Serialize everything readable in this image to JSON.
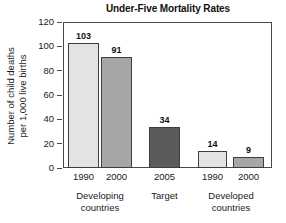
{
  "chart_data": {
    "type": "bar",
    "title": "Under-Five Mortality Rates",
    "xlabel": "",
    "ylabel": "Number of child deaths per 1,000 live births",
    "ylabel_lines": [
      "Number of child deaths",
      "per 1,000 live births"
    ],
    "ylim": [
      0,
      120
    ],
    "yticks": [
      0,
      20,
      40,
      60,
      80,
      100,
      120
    ],
    "ytick_labels": [
      "0",
      "20",
      "40",
      "60",
      "80",
      "100",
      "120"
    ],
    "grid": false,
    "legend": "none",
    "categories": [
      "1990",
      "2000",
      "2005",
      "1990",
      "2000"
    ],
    "values": [
      103,
      91,
      34,
      14,
      9
    ],
    "value_labels": [
      "103",
      "91",
      "34",
      "14",
      "9"
    ],
    "bar_colors": [
      "#e3e3e3",
      "#a6a6a6",
      "#5b5b5b",
      "#e3e3e3",
      "#a6a6a6"
    ],
    "bar_edge_color": "#3d3d3d",
    "groups": [
      {
        "label_lines": [
          "Developing",
          "countries"
        ],
        "bar_indices": [
          0,
          1
        ]
      },
      {
        "label_lines": [
          "Target"
        ],
        "bar_indices": [
          2
        ]
      },
      {
        "label_lines": [
          "Developed",
          "countries"
        ],
        "bar_indices": [
          3,
          4
        ]
      }
    ],
    "axis_color": "#4a4a4a",
    "background": "#ffffff"
  }
}
